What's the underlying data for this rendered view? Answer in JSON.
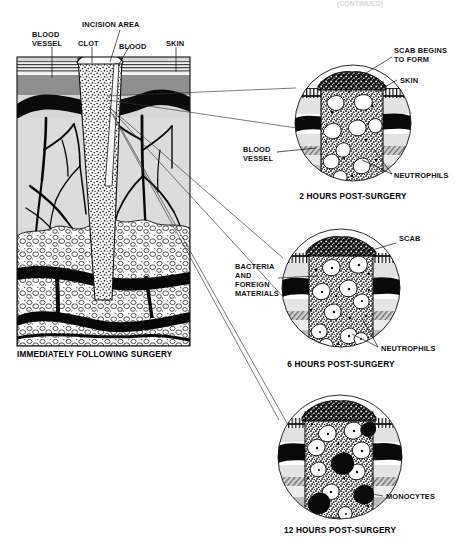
{
  "figure": {
    "title_cropped": "(CONTINUED)",
    "panels": [
      {
        "id": "main",
        "caption": "IMMEDIATELY FOLLOWING SURGERY",
        "labels": [
          {
            "name": "blood-vessel",
            "lines": [
              "BLOOD",
              "VESSEL"
            ]
          },
          {
            "name": "clot",
            "lines": [
              "CLOT"
            ]
          },
          {
            "name": "incision-area",
            "lines": [
              "INCISION AREA"
            ]
          },
          {
            "name": "blood",
            "lines": [
              "BLOOD"
            ]
          },
          {
            "name": "skin",
            "lines": [
              "SKIN"
            ]
          }
        ]
      },
      {
        "id": "inset-2h",
        "caption": "2 HOURS POST-SURGERY",
        "labels": [
          {
            "name": "scab-begins-to-form",
            "lines": [
              "SCAB BEGINS",
              "TO FORM"
            ]
          },
          {
            "name": "skin",
            "lines": [
              "SKIN"
            ]
          },
          {
            "name": "blood-vessel",
            "lines": [
              "BLOOD",
              "VESSEL"
            ]
          },
          {
            "name": "neutrophils",
            "lines": [
              "NEUTROPHILS"
            ]
          }
        ]
      },
      {
        "id": "inset-6h",
        "caption": "6 HOURS POST-SURGERY",
        "labels": [
          {
            "name": "scab",
            "lines": [
              "SCAB"
            ]
          },
          {
            "name": "bacteria-and-foreign-materials",
            "lines": [
              "BACTERIA",
              "AND",
              "FOREIGN",
              "MATERIALS"
            ]
          },
          {
            "name": "neutrophils",
            "lines": [
              "NEUTROPHILS"
            ]
          }
        ]
      },
      {
        "id": "inset-12h",
        "caption": "12 HOURS POST-SURGERY",
        "labels": [
          {
            "name": "monocytes",
            "lines": [
              "MONOCYTES"
            ]
          }
        ]
      }
    ]
  },
  "text": {
    "top_cropped": "(CONTINUED)",
    "main_caption": "IMMEDIATELY FOLLOWING SURGERY",
    "m_blood_1": "BLOOD",
    "m_blood_2": "VESSEL",
    "m_clot": "CLOT",
    "m_incision": "INCISION AREA",
    "m_blood": "BLOOD",
    "m_skin": "SKIN",
    "c1_caption": "2 HOURS POST-SURGERY",
    "c1_scab_1": "SCAB BEGINS",
    "c1_scab_2": "TO FORM",
    "c1_skin": "SKIN",
    "c1_bv_1": "BLOOD",
    "c1_bv_2": "VESSEL",
    "c1_neut": "NEUTROPHILS",
    "c2_caption": "6 HOURS POST-SURGERY",
    "c2_scab": "SCAB",
    "c2_bact_1": "BACTERIA",
    "c2_bact_2": "AND",
    "c2_bact_3": "FOREIGN",
    "c2_bact_4": "MATERIALS",
    "c2_neut": "NEUTROPHILS",
    "c3_caption": "12 HOURS POST-SURGERY",
    "c3_mono": "MONOCYTES"
  },
  "colors": {
    "ink": "#111111",
    "epidermis": "#e9e9e9",
    "dermis_gray": "#9a9a9a",
    "subdermis": "#d9d9d9",
    "fat": "#ffffff",
    "vessel_black": "#000000",
    "clot_fill": "#ffffff",
    "scab": "#1a1a1a",
    "background": "#ffffff"
  }
}
